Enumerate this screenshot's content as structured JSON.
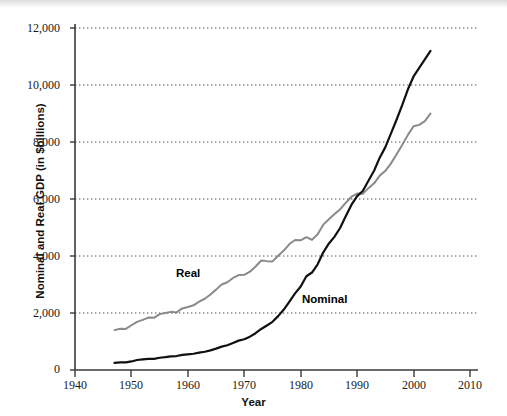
{
  "chart_data": {
    "type": "line",
    "title": "",
    "xlabel": "Year",
    "ylabel": "Nominal and Real GDP (in $billions)",
    "xlim": [
      1940,
      2010
    ],
    "ylim": [
      0,
      12000
    ],
    "xticks": [
      1940,
      1950,
      1960,
      1970,
      1980,
      1990,
      2000,
      2010
    ],
    "xtick_labels": [
      "1940",
      "1950",
      "1960",
      "1970",
      "1980",
      "1990",
      "2000",
      "2010"
    ],
    "yticks": [
      0,
      2000,
      4000,
      6000,
      8000,
      10000,
      12000
    ],
    "ytick_labels": [
      "0",
      "2,000",
      "4,000",
      "6,000",
      "8,000",
      "10,000",
      "12,000"
    ],
    "grid": "horizontal-dotted",
    "legend_position": "inline-annotations",
    "series": [
      {
        "name": "Real",
        "label": "Real",
        "color": "#8a8a8a",
        "linewidth": 2.0,
        "x": [
          1947,
          1948,
          1949,
          1950,
          1951,
          1952,
          1953,
          1954,
          1955,
          1956,
          1957,
          1958,
          1959,
          1960,
          1961,
          1962,
          1963,
          1964,
          1965,
          1966,
          1967,
          1968,
          1969,
          1970,
          1971,
          1972,
          1973,
          1974,
          1975,
          1976,
          1977,
          1978,
          1979,
          1980,
          1981,
          1982,
          1983,
          1984,
          1985,
          1986,
          1987,
          1988,
          1989,
          1990,
          1991,
          1992,
          1993,
          1994,
          1995,
          1996,
          1997,
          1998,
          1999,
          2000,
          2001,
          2002,
          2003
        ],
        "values": [
          1400,
          1450,
          1440,
          1570,
          1690,
          1760,
          1840,
          1830,
          1960,
          2000,
          2040,
          2020,
          2160,
          2210,
          2270,
          2400,
          2500,
          2650,
          2820,
          3000,
          3080,
          3230,
          3330,
          3340,
          3450,
          3630,
          3840,
          3820,
          3810,
          4010,
          4190,
          4420,
          4560,
          4550,
          4660,
          4570,
          4760,
          5100,
          5290,
          5470,
          5640,
          5870,
          6080,
          6190,
          6180,
          6380,
          6550,
          6820,
          6990,
          7250,
          7570,
          7900,
          8250,
          8550,
          8600,
          8730,
          9000
        ],
        "start_value": 1400,
        "end_value": 9500,
        "notes": "Real GDP in chained dollars; visible dips around 1949, 1954, 1958, 1974-75, 1980-82, 1991, 2001"
      },
      {
        "name": "Nominal",
        "label": "Nominal",
        "color": "#111111",
        "linewidth": 2.2,
        "x": [
          1947,
          1948,
          1949,
          1950,
          1951,
          1952,
          1953,
          1954,
          1955,
          1956,
          1957,
          1958,
          1959,
          1960,
          1961,
          1962,
          1963,
          1964,
          1965,
          1966,
          1967,
          1968,
          1969,
          1970,
          1971,
          1972,
          1973,
          1974,
          1975,
          1976,
          1977,
          1978,
          1979,
          1980,
          1981,
          1982,
          1983,
          1984,
          1985,
          1986,
          1987,
          1988,
          1989,
          1990,
          1991,
          1992,
          1993,
          1994,
          1995,
          1996,
          1997,
          1998,
          1999,
          2000,
          2001,
          2002,
          2003
        ],
        "values": [
          250,
          270,
          270,
          300,
          350,
          370,
          390,
          390,
          430,
          450,
          480,
          490,
          530,
          550,
          570,
          610,
          640,
          690,
          750,
          820,
          870,
          950,
          1030,
          1080,
          1170,
          1290,
          1440,
          1560,
          1690,
          1890,
          2120,
          2400,
          2690,
          2930,
          3290,
          3420,
          3710,
          4130,
          4440,
          4680,
          4990,
          5400,
          5800,
          6100,
          6280,
          6640,
          6990,
          7450,
          7820,
          8300,
          8790,
          9300,
          9850,
          10300,
          10600,
          10900,
          11200
        ],
        "start_value": 250,
        "end_value": 10700,
        "notes": "Nominal GDP in current dollars; crosses Real line near 1996-1997 at about 7,800"
      }
    ],
    "annotations": [
      {
        "text": "Real",
        "x": 1966,
        "y": 3500
      },
      {
        "text": "Nominal",
        "x": 1986,
        "y": 2600
      }
    ]
  },
  "axes": {
    "y_label": "Nominal and Real GDP (in $billions)",
    "x_label": "Year"
  }
}
